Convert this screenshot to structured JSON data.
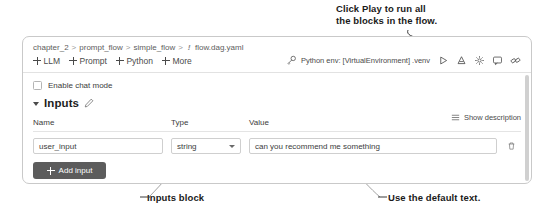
{
  "annotations": {
    "play": "Click Play to run all\nthe blocks in the flow.",
    "inputs_block": "Inputs block",
    "default_text": "Use the default text."
  },
  "panel": {
    "breadcrumb": {
      "items": [
        "chapter_2",
        "prompt_flow",
        "simple_flow",
        "flow.dag.yaml"
      ],
      "separator": ">",
      "file_marker": "!"
    },
    "toolbar": {
      "add_items": [
        {
          "label": "LLM",
          "icon": "plus-icon"
        },
        {
          "label": "Prompt",
          "icon": "plus-icon"
        },
        {
          "label": "Python",
          "icon": "plus-icon"
        },
        {
          "label": "More",
          "icon": "plus-icon"
        }
      ],
      "env_icon": "key-icon",
      "env_label": "Python env: [VirtualEnvironment] .venv",
      "icons": [
        {
          "name": "play-icon"
        },
        {
          "name": "debug-icon"
        },
        {
          "name": "settings-icon"
        },
        {
          "name": "chat-icon"
        },
        {
          "name": "share-icon"
        }
      ]
    },
    "chat_mode": {
      "label": "Enable chat mode",
      "checked": false
    },
    "inputs_section": {
      "title": "Inputs",
      "collapse_icon": "chevron-down-icon",
      "edit_icon": "pencil-icon",
      "show_description": "Show description",
      "show_description_icon": "list-icon"
    },
    "inputs_table": {
      "columns": [
        "Name",
        "Type",
        "Value"
      ],
      "rows": [
        {
          "name": "user_input",
          "type": "string",
          "value": "can you recommend me something",
          "delete_icon": "trash-icon"
        }
      ]
    },
    "add_input_button": {
      "label": "Add input",
      "icon": "plus-icon"
    }
  },
  "colors": {
    "panel_border": "#c9c9c9",
    "button_bg": "#5c5c5c",
    "text": "#3c3c3c",
    "muted": "#5d5d5d"
  }
}
